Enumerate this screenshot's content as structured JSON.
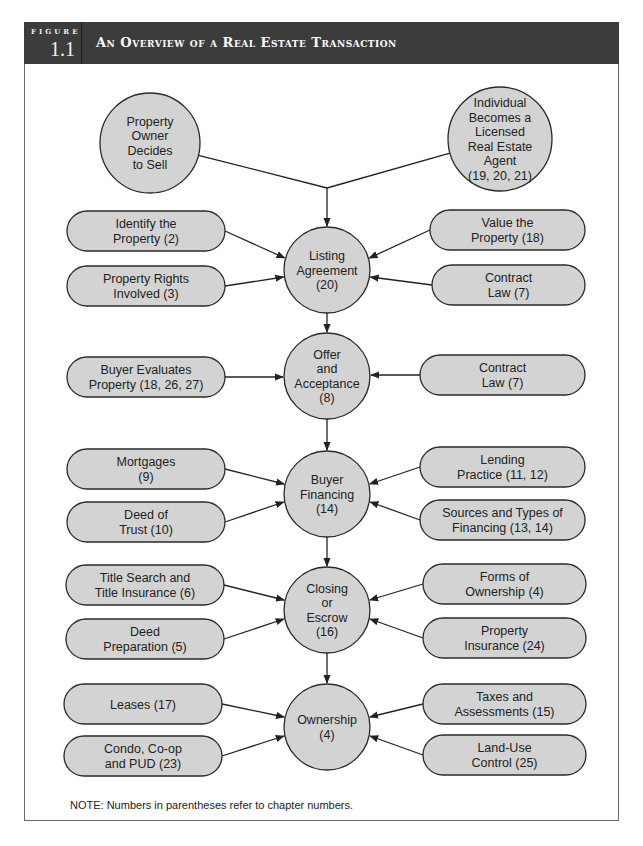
{
  "header": {
    "figure_label": "FIGURE",
    "figure_number": "1.1",
    "title": "An Overview of a Real Estate Transaction",
    "bg_color": "#3c3c3c"
  },
  "colors": {
    "node_fill": "#d3d3d3",
    "node_stroke": "#2a2a2a",
    "edge": "#222222"
  },
  "top_nodes": [
    {
      "id": "owner-decides",
      "lines": [
        "Property",
        "Owner",
        "Decides",
        "to Sell"
      ],
      "cx": 150,
      "cy": 143,
      "r": 50
    },
    {
      "id": "licensed-agent",
      "lines": [
        "Individual",
        "Becomes a",
        "Licensed",
        "Real Estate",
        "Agent",
        "(19, 20, 21)"
      ],
      "cx": 500,
      "cy": 139,
      "r": 52
    }
  ],
  "main_nodes": [
    {
      "id": "listing-agreement",
      "lines": [
        "Listing",
        "Agreement",
        "(20)"
      ],
      "cx": 327,
      "cy": 270,
      "r": 43
    },
    {
      "id": "offer-acceptance",
      "lines": [
        "Offer",
        "and",
        "Acceptance",
        "(8)"
      ],
      "cx": 327,
      "cy": 376,
      "r": 43
    },
    {
      "id": "buyer-financing",
      "lines": [
        "Buyer",
        "Financing",
        "(14)"
      ],
      "cx": 327,
      "cy": 494,
      "r": 43
    },
    {
      "id": "closing-escrow",
      "lines": [
        "Closing",
        "or",
        "Escrow",
        "(16)"
      ],
      "cx": 327,
      "cy": 610,
      "r": 43
    },
    {
      "id": "ownership",
      "lines": [
        "Ownership",
        "(4)"
      ],
      "cx": 327,
      "cy": 727,
      "r": 43
    }
  ],
  "side_nodes": [
    {
      "id": "identify-property",
      "side": "left",
      "target": 0,
      "lines": [
        "Identify the",
        "Property (2)"
      ],
      "x": 67,
      "y": 211,
      "w": 158,
      "h": 40,
      "ty": 258
    },
    {
      "id": "property-rights",
      "side": "left",
      "target": 0,
      "lines": [
        "Property Rights",
        "Involved (3)"
      ],
      "x": 67,
      "y": 266,
      "w": 158,
      "h": 40,
      "ty": 277
    },
    {
      "id": "value-property",
      "side": "right",
      "target": 0,
      "lines": [
        "Value the",
        "Property (18)"
      ],
      "x": 430,
      "y": 210,
      "w": 155,
      "h": 40,
      "ty": 258
    },
    {
      "id": "contract-law-1",
      "side": "right",
      "target": 0,
      "lines": [
        "Contract",
        "Law (7)"
      ],
      "x": 432,
      "y": 265,
      "w": 153,
      "h": 40,
      "ty": 277
    },
    {
      "id": "buyer-evaluates",
      "side": "left",
      "target": 1,
      "lines": [
        "Buyer Evaluates",
        "Property (18, 26, 27)"
      ],
      "x": 67,
      "y": 357,
      "w": 158,
      "h": 40,
      "ty": 377
    },
    {
      "id": "contract-law-2",
      "side": "right",
      "target": 1,
      "lines": [
        "Contract",
        "Law (7)"
      ],
      "x": 420,
      "y": 355,
      "w": 165,
      "h": 40,
      "ty": 375
    },
    {
      "id": "mortgages",
      "side": "left",
      "target": 2,
      "lines": [
        "Mortgages",
        "(9)"
      ],
      "x": 67,
      "y": 449,
      "w": 158,
      "h": 40,
      "ty": 484
    },
    {
      "id": "deed-of-trust",
      "side": "left",
      "target": 2,
      "lines": [
        "Deed of",
        "Trust (10)"
      ],
      "x": 67,
      "y": 502,
      "w": 158,
      "h": 40,
      "ty": 502
    },
    {
      "id": "lending-practice",
      "side": "right",
      "target": 2,
      "lines": [
        "Lending",
        "Practice (11, 12)"
      ],
      "x": 420,
      "y": 447,
      "w": 165,
      "h": 40,
      "ty": 484
    },
    {
      "id": "sources-financing",
      "side": "right",
      "target": 2,
      "lines": [
        "Sources and Types of",
        "Financing (13, 14)"
      ],
      "x": 420,
      "y": 500,
      "w": 165,
      "h": 40,
      "ty": 502
    },
    {
      "id": "title-search",
      "side": "left",
      "target": 3,
      "lines": [
        "Title Search and",
        "Title Insurance (6)"
      ],
      "x": 66,
      "y": 565,
      "w": 158,
      "h": 40,
      "ty": 600
    },
    {
      "id": "deed-preparation",
      "side": "left",
      "target": 3,
      "lines": [
        "Deed",
        "Preparation (5)"
      ],
      "x": 66,
      "y": 619,
      "w": 158,
      "h": 40,
      "ty": 619
    },
    {
      "id": "forms-ownership",
      "side": "right",
      "target": 3,
      "lines": [
        "Forms of",
        "Ownership (4)"
      ],
      "x": 423,
      "y": 564,
      "w": 163,
      "h": 40,
      "ty": 600
    },
    {
      "id": "property-insurance",
      "side": "right",
      "target": 3,
      "lines": [
        "Property",
        "Insurance (24)"
      ],
      "x": 423,
      "y": 618,
      "w": 163,
      "h": 40,
      "ty": 619
    },
    {
      "id": "leases",
      "side": "left",
      "target": 4,
      "lines": [
        "Leases (17)"
      ],
      "x": 64,
      "y": 684,
      "w": 158,
      "h": 40,
      "ty": 717
    },
    {
      "id": "condo-coop",
      "side": "left",
      "target": 4,
      "lines": [
        "Condo, Co-op",
        "and PUD (23)"
      ],
      "x": 64,
      "y": 736,
      "w": 158,
      "h": 40,
      "ty": 736
    },
    {
      "id": "taxes-assessments",
      "side": "right",
      "target": 4,
      "lines": [
        "Taxes and",
        "Assessments (15)"
      ],
      "x": 423,
      "y": 684,
      "w": 163,
      "h": 40,
      "ty": 717
    },
    {
      "id": "land-use-control",
      "side": "right",
      "target": 4,
      "lines": [
        "Land-Use",
        "Control (25)"
      ],
      "x": 423,
      "y": 735,
      "w": 163,
      "h": 40,
      "ty": 736
    }
  ],
  "merge_point": {
    "x": 327,
    "y": 188
  },
  "note": "NOTE: Numbers in parentheses refer to chapter numbers."
}
